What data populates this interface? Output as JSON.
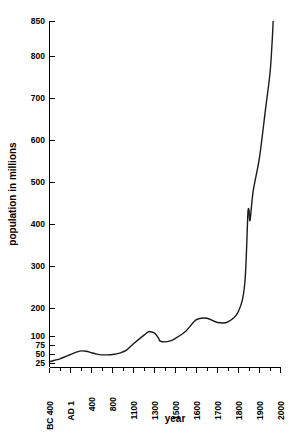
{
  "chart_data": {
    "type": "line",
    "title": "",
    "xlabel": "year",
    "ylabel": "population in millions",
    "grid": false,
    "legend": "none",
    "x_scale": "ordinal-nonlinear",
    "y_scale": "nonlinear-compressed-low",
    "x_tick_labels": [
      "BC 400",
      "AD 1",
      "400",
      "800",
      "1100",
      "1300",
      "1500",
      "1600",
      "1700",
      "1800",
      "1900",
      "2000"
    ],
    "x_tick_values": [
      -400,
      1,
      400,
      800,
      1100,
      1300,
      1500,
      1600,
      1700,
      1800,
      1900,
      2000
    ],
    "y_tick_labels": [
      "25",
      "50",
      "75",
      "100",
      "200",
      "300",
      "400",
      "500",
      "600",
      "700",
      "800",
      "850"
    ],
    "y_tick_values": [
      25,
      50,
      75,
      100,
      200,
      300,
      400,
      500,
      600,
      700,
      800,
      850
    ],
    "ylim": [
      25,
      850
    ],
    "xlim": [
      -400,
      2000
    ],
    "series": [
      {
        "name": "world population",
        "x": [
          -400,
          -300,
          -200,
          -100,
          1,
          100,
          200,
          300,
          400,
          500,
          600,
          700,
          800,
          900,
          1000,
          1100,
          1200,
          1250,
          1300,
          1340,
          1350,
          1400,
          1450,
          1500,
          1550,
          1600,
          1650,
          1700,
          1750,
          1800,
          1830,
          1845,
          1850,
          1855,
          1870,
          1900,
          1930,
          1950,
          1960,
          1965
        ],
        "values": [
          30,
          34,
          38,
          44,
          50,
          56,
          60,
          59,
          55,
          51,
          49,
          49,
          50,
          54,
          62,
          80,
          105,
          118,
          112,
          95,
          88,
          85,
          88,
          95,
          120,
          160,
          165,
          150,
          152,
          190,
          260,
          430,
          435,
          410,
          480,
          560,
          680,
          760,
          820,
          850
        ]
      }
    ],
    "annotations": [
      {
        "label": "plateau / decline after Black Death",
        "x_range": [
          1300,
          1450
        ]
      },
      {
        "label": "notch",
        "x": 1850,
        "values": [
          435,
          410
        ]
      }
    ]
  },
  "axes": {
    "y_title": "population in millions",
    "x_title": "year"
  }
}
